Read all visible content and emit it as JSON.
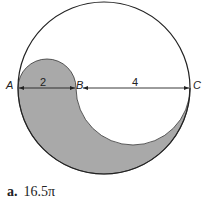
{
  "diagram": {
    "points": {
      "a": "A",
      "b": "B",
      "c": "C"
    },
    "measurements": {
      "ab": "2",
      "bc": "4"
    },
    "fill_color": "#a9a9a9",
    "stroke_color": "#222222"
  },
  "answer": {
    "letter": "a.",
    "value": "16.5π"
  }
}
